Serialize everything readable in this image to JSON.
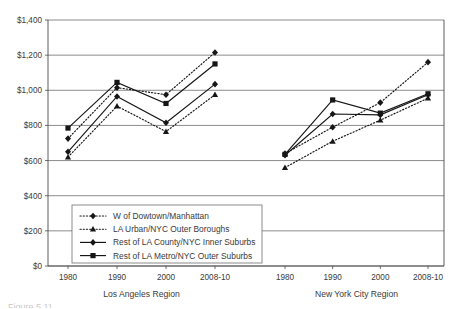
{
  "chart_data": {
    "type": "line",
    "title": "",
    "xlabel": "",
    "ylabel": "",
    "ylim": [
      0,
      1400
    ],
    "ytick_step": 200,
    "grid": true,
    "legend_position": "inside-bottom-left",
    "ytick_labels": [
      "$1,400",
      "$1,200",
      "$1,000",
      "$800",
      "$600",
      "$400",
      "$200",
      "$0"
    ],
    "ytick_values": [
      1400,
      1200,
      1000,
      800,
      600,
      400,
      200,
      0
    ],
    "categories": [
      "1980",
      "1990",
      "2000",
      "2008-10"
    ],
    "panels": [
      {
        "name": "Los Angeles Region",
        "label": "Los Angeles Region",
        "xtick_labels": [
          "1980",
          "1990",
          "2000",
          "2008-10"
        ],
        "series": [
          {
            "name": "W of Dowtown/Manhattan",
            "style": "dotted",
            "marker": "diamond",
            "values": [
              725,
              1015,
              975,
              1215
            ]
          },
          {
            "name": "LA Urban/NYC Outer Boroughs",
            "style": "dotted",
            "marker": "triangle",
            "values": [
              620,
              910,
              765,
              975
            ]
          },
          {
            "name": "Rest of LA County/NYC Inner Suburbs",
            "style": "solid",
            "marker": "diamond",
            "values": [
              650,
              965,
              815,
              1035
            ]
          },
          {
            "name": "Rest of LA Metro/NYC Outer Suburbs",
            "style": "solid",
            "marker": "square",
            "values": [
              785,
              1045,
              925,
              1150
            ]
          }
        ]
      },
      {
        "name": "New York City Region",
        "label": "New York City Region",
        "xtick_labels": [
          "1980",
          "1990",
          "2000",
          "2008-10"
        ],
        "series": [
          {
            "name": "W of Dowtown/Manhattan",
            "style": "dotted",
            "marker": "diamond",
            "values": [
              640,
              790,
              930,
              1160
            ]
          },
          {
            "name": "LA Urban/NYC Outer Boroughs",
            "style": "dotted",
            "marker": "triangle",
            "values": [
              560,
              710,
              830,
              955
            ]
          },
          {
            "name": "Rest of LA County/NYC Inner Suburbs",
            "style": "solid",
            "marker": "diamond",
            "values": [
              630,
              865,
              860,
              975
            ]
          },
          {
            "name": "Rest of LA Metro/NYC Outer Suburbs",
            "style": "solid",
            "marker": "square",
            "values": [
              635,
              945,
              870,
              980
            ]
          }
        ]
      }
    ],
    "legend": [
      {
        "label": "W of Dowtown/Manhattan",
        "style": "dotted",
        "marker": "diamond"
      },
      {
        "label": "LA Urban/NYC Outer Boroughs",
        "style": "dotted",
        "marker": "triangle"
      },
      {
        "label": "Rest of LA County/NYC Inner Suburbs",
        "style": "solid",
        "marker": "diamond"
      },
      {
        "label": "Rest of LA Metro/NYC Outer Suburbs",
        "style": "solid",
        "marker": "square"
      }
    ],
    "colors": {
      "series": "#161616",
      "grid": "#6f6f6f",
      "axis": "#4a4a4a",
      "text": "#3a3a3a"
    }
  },
  "caption": {
    "text": "Figure 5.11"
  }
}
